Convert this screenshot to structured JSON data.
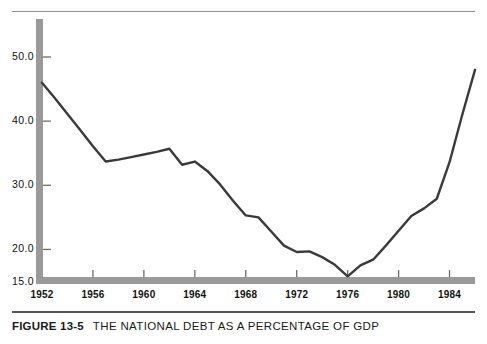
{
  "figure": {
    "number_label": "FIGURE 13-5",
    "title": "THE NATIONAL DEBT AS A PERCENTAGE OF GDP"
  },
  "axis_colors": {
    "axis_bar": "#9a9a9a",
    "line": "#3a3a3a",
    "rule": "#8c8c8c",
    "text": "#111111"
  },
  "chart_data": {
    "type": "line",
    "title": "THE NATIONAL DEBT AS A PERCENTAGE OF GDP",
    "xlabel": "",
    "ylabel": "",
    "grid": false,
    "legend": null,
    "xlim": [
      1952,
      1986
    ],
    "ylim": [
      15.0,
      54.0
    ],
    "yticks": [
      15.0,
      20.0,
      30.0,
      40.0,
      50.0
    ],
    "ytick_labels": [
      "15.0",
      "20.0",
      "30.0",
      "40.0",
      "50.0"
    ],
    "xticks": [
      1952,
      1956,
      1960,
      1964,
      1968,
      1972,
      1976,
      1980,
      1984
    ],
    "xtick_labels": [
      "1952",
      "1956",
      "1960",
      "1964",
      "1968",
      "1972",
      "1976",
      "1980",
      "1984"
    ],
    "series": [
      {
        "name": "National debt as a percentage of GDP",
        "x": [
          1952,
          1953,
          1954,
          1955,
          1956,
          1957,
          1958,
          1959,
          1960,
          1961,
          1962,
          1963,
          1964,
          1965,
          1966,
          1967,
          1968,
          1969,
          1970,
          1971,
          1972,
          1973,
          1974,
          1975,
          1976,
          1977,
          1978,
          1979,
          1980,
          1981,
          1982,
          1983,
          1984,
          1985,
          1986
        ],
        "values": [
          46.0,
          43.6,
          41.1,
          38.6,
          36.1,
          33.7,
          34.0,
          34.4,
          34.8,
          35.2,
          35.7,
          33.2,
          33.7,
          32.2,
          30.1,
          27.6,
          25.3,
          25.0,
          22.8,
          20.6,
          19.6,
          19.7,
          18.8,
          17.6,
          15.8,
          17.5,
          18.4,
          20.6,
          22.9,
          25.2,
          26.4,
          27.9,
          33.6,
          41.0,
          48.0
        ]
      }
    ]
  }
}
